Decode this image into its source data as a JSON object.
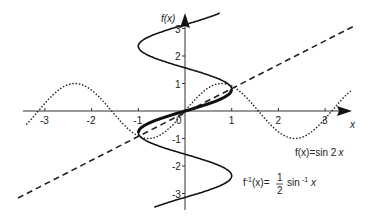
{
  "chart_data": {
    "type": "line",
    "title": "",
    "xlabel": "x",
    "ylabel": "f(x)",
    "xlim": [
      -3.6,
      3.8
    ],
    "ylim": [
      -3.6,
      3.7
    ],
    "grid": false,
    "x_ticks": [
      -3,
      -2,
      -1,
      1,
      2,
      3
    ],
    "y_ticks": [
      -3,
      -2,
      -1,
      1,
      2,
      3
    ],
    "x_tick_labels": [
      "-3",
      "-2",
      "-1",
      "1",
      "2",
      "3"
    ],
    "y_tick_labels": [
      "-3",
      "-2",
      "-1",
      "1",
      "2",
      "3"
    ],
    "origin_label": "0",
    "series": [
      {
        "name": "f(x) = sin 2x",
        "style": "dotted",
        "expression": "y = sin(2x)",
        "domain": [
          -3.4,
          3.55
        ]
      },
      {
        "name": "y = x",
        "style": "dashed",
        "expression": "y = x",
        "domain": [
          -3.6,
          3.6
        ]
      },
      {
        "name": "x = sin 2y",
        "style": "solid-thin",
        "expression": "x = sin(2y)",
        "range": [
          -3.5,
          3.56
        ]
      },
      {
        "name": "f^-1(x) = 1/2 sin^-1 x",
        "style": "solid-bold",
        "expression": "y = 0.5*asin(x)",
        "domain": [
          -1,
          1
        ]
      }
    ],
    "annotations": [
      {
        "text": "f(x) = sin 2x",
        "near": [
          2.4,
          -1.5
        ]
      },
      {
        "text": "f^-1(x) = 1/2 sin^-1 x",
        "near": [
          1.9,
          -2.6
        ]
      }
    ]
  },
  "labels": {
    "y_axis": "f(x)",
    "x_axis": "x",
    "origin": "0",
    "x_ticks": [
      "-3",
      "-2",
      "-1",
      "1",
      "2",
      "3"
    ],
    "y_ticks": [
      "3",
      "2",
      "1",
      "-1",
      "-2",
      "-3"
    ],
    "f_label_prefix": "f",
    "f_label_body": "(x)=sin 2",
    "f_label_var": "x",
    "finv_label_prefix": "f",
    "finv_label_sup": "-1",
    "finv_label_body": "(x)=",
    "finv_frac_num": "1",
    "finv_frac_den": "2",
    "finv_sin": "sin",
    "finv_sin_sup": "-1",
    "finv_var": "x"
  }
}
